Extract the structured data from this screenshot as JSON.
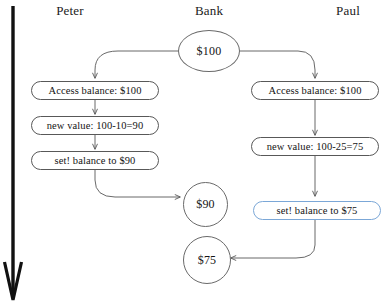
{
  "diagram": {
    "colors": {
      "stroke": "#585858",
      "circle_stroke": "#6a6a6a",
      "highlight_border": "#7ba7d7",
      "timeline": "#111111",
      "text": "#141414",
      "background": "#ffffff"
    },
    "lanes": [
      {
        "id": "peter",
        "label": "Peter"
      },
      {
        "id": "bank",
        "label": "Bank"
      },
      {
        "id": "paul",
        "label": "Paul"
      }
    ],
    "timeline": {
      "name": "time-axis-arrow",
      "direction": "downward"
    },
    "nodes": {
      "bank_initial": {
        "label": "$100",
        "shape": "circle"
      },
      "peter_access": {
        "label": "Access balance: $100",
        "shape": "rounded-box"
      },
      "peter_compute": {
        "label": "new value: 100-10=90",
        "shape": "rounded-box"
      },
      "peter_set": {
        "label": "set! balance to $90",
        "shape": "rounded-box"
      },
      "bank_after_peter": {
        "label": "$90",
        "shape": "circle"
      },
      "paul_access": {
        "label": "Access balance: $100",
        "shape": "rounded-box"
      },
      "paul_compute": {
        "label": "new value: 100-25=75",
        "shape": "rounded-box"
      },
      "paul_set": {
        "label": "set! balance to $75",
        "shape": "rounded-box",
        "highlighted": true
      },
      "bank_after_paul": {
        "label": "$75",
        "shape": "circle"
      }
    }
  }
}
